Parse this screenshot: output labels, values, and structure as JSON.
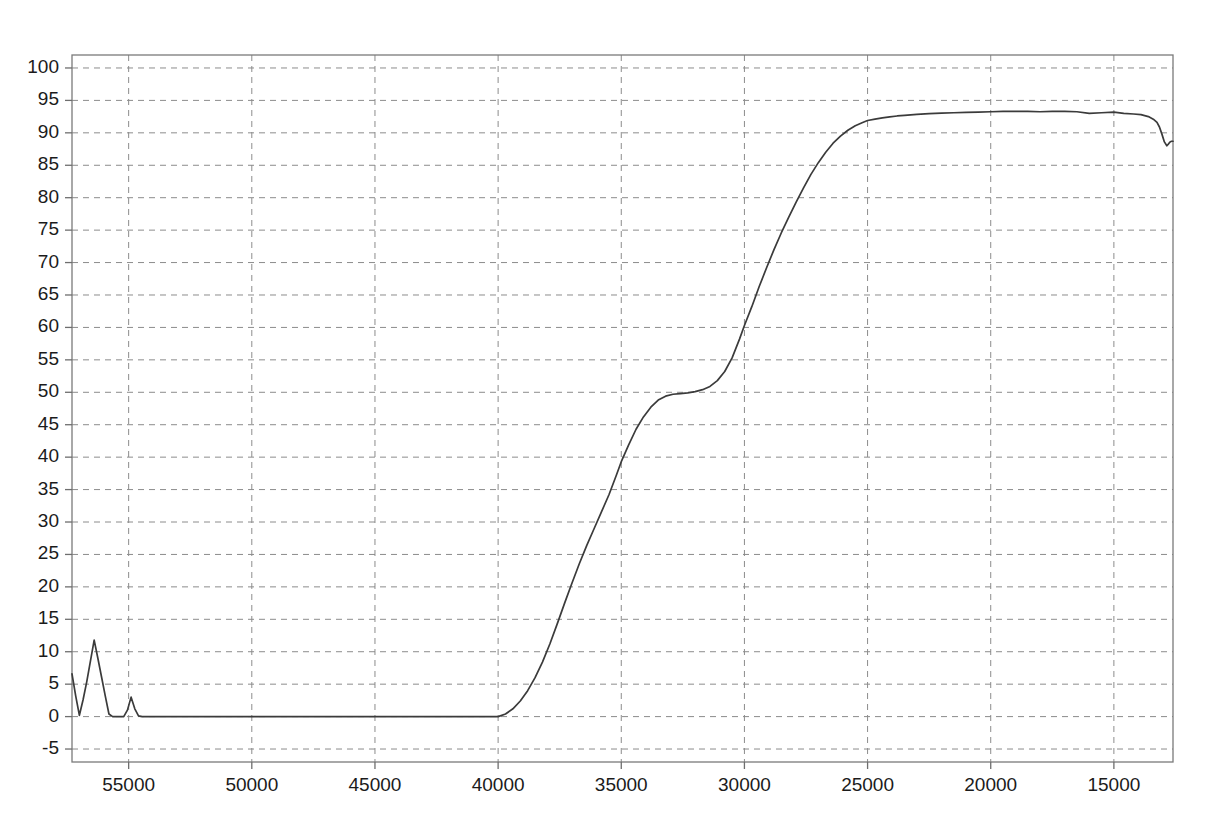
{
  "chart_data": {
    "type": "line",
    "title": "",
    "subtitle": "",
    "xlabel": "",
    "ylabel": "",
    "xlim": [
      57300,
      12600
    ],
    "ylim": [
      -7,
      102
    ],
    "x_axis_reversed": true,
    "grid": true,
    "legend": "none",
    "x_ticks": [
      55000,
      50000,
      45000,
      40000,
      35000,
      30000,
      25000,
      20000,
      15000
    ],
    "x_tick_labels": [
      "55000",
      "50000",
      "45000",
      "40000",
      "35000",
      "30000",
      "25000",
      "20000",
      "15000"
    ],
    "y_ticks": [
      -5,
      0,
      5,
      10,
      15,
      20,
      25,
      30,
      35,
      40,
      45,
      50,
      55,
      60,
      65,
      70,
      75,
      80,
      85,
      90,
      95,
      100
    ],
    "y_tick_labels": [
      "-5",
      "0",
      "5",
      "10",
      "15",
      "20",
      "25",
      "30",
      "35",
      "40",
      "45",
      "50",
      "55",
      "60",
      "65",
      "70",
      "75",
      "80",
      "85",
      "90",
      "95",
      "100"
    ],
    "series": [
      {
        "name": "transmittance",
        "color": "#3b3b3b",
        "x": [
          57300,
          57150,
          57000,
          56850,
          56700,
          56550,
          56400,
          56250,
          56100,
          55950,
          55800,
          55650,
          55500,
          55350,
          55200,
          55050,
          54900,
          54750,
          54600,
          54450,
          54300,
          54150,
          54000,
          53500,
          53000,
          52000,
          51000,
          50000,
          49000,
          48000,
          47000,
          46000,
          45000,
          44000,
          43000,
          42000,
          41000,
          40500,
          40000,
          39700,
          39400,
          39100,
          38800,
          38500,
          38200,
          37900,
          37600,
          37300,
          37000,
          36700,
          36400,
          36100,
          35800,
          35500,
          35200,
          35000,
          34700,
          34400,
          34100,
          33800,
          33500,
          33200,
          32900,
          32600,
          32300,
          32000,
          31700,
          31400,
          31100,
          30800,
          30500,
          30200,
          30000,
          29700,
          29400,
          29100,
          28800,
          28500,
          28200,
          27900,
          27600,
          27300,
          27000,
          26700,
          26400,
          26100,
          25800,
          25500,
          25200,
          25000,
          24700,
          24400,
          24100,
          23800,
          23500,
          23000,
          22500,
          22000,
          21500,
          21000,
          20500,
          20000,
          19500,
          19000,
          18500,
          18000,
          17500,
          17000,
          16500,
          16000,
          15500,
          15000,
          14600,
          14200,
          13900,
          13600,
          13400,
          13250,
          13150,
          13050,
          12950,
          12850,
          12780,
          12720,
          12660,
          12600
        ],
        "y": [
          6.6,
          3.2,
          0.2,
          2.6,
          5.4,
          8.6,
          11.8,
          9.0,
          6.1,
          3.2,
          0.4,
          0.0,
          0.0,
          0.0,
          0.0,
          1.0,
          3.0,
          1.2,
          0.1,
          0.0,
          0.0,
          0.0,
          0.0,
          0.0,
          0.0,
          0.0,
          0.0,
          0.0,
          0.0,
          0.0,
          0.0,
          0.0,
          0.0,
          0.0,
          0.0,
          0.0,
          0.0,
          0.0,
          0.0,
          0.4,
          1.2,
          2.4,
          4.0,
          6.0,
          8.4,
          11.2,
          14.3,
          17.5,
          20.6,
          23.6,
          26.4,
          29.0,
          31.6,
          34.2,
          37.2,
          39.3,
          41.9,
          44.3,
          46.2,
          47.7,
          48.8,
          49.4,
          49.7,
          49.8,
          49.9,
          50.1,
          50.4,
          50.9,
          51.8,
          53.2,
          55.3,
          58.2,
          60.3,
          63.2,
          66.3,
          69.2,
          72.0,
          74.6,
          77.0,
          79.3,
          81.5,
          83.6,
          85.4,
          87.0,
          88.4,
          89.5,
          90.4,
          91.1,
          91.6,
          91.9,
          92.1,
          92.3,
          92.45,
          92.6,
          92.7,
          92.85,
          92.95,
          93.05,
          93.1,
          93.15,
          93.2,
          93.25,
          93.3,
          93.3,
          93.3,
          93.25,
          93.3,
          93.3,
          93.25,
          93.0,
          93.1,
          93.2,
          93.0,
          92.9,
          92.8,
          92.5,
          92.1,
          91.6,
          90.9,
          89.8,
          88.6,
          88.0,
          88.3,
          88.6,
          88.7,
          88.7
        ]
      }
    ],
    "annotations": []
  },
  "layout": {
    "plot_left": 72,
    "plot_right": 1173,
    "plot_top": 55,
    "plot_bottom": 762,
    "background": "#ffffff",
    "grid_color": "#8c8c8c",
    "frame_color": "#7a7a7a",
    "axis_text_color": "#1b1b1b"
  }
}
